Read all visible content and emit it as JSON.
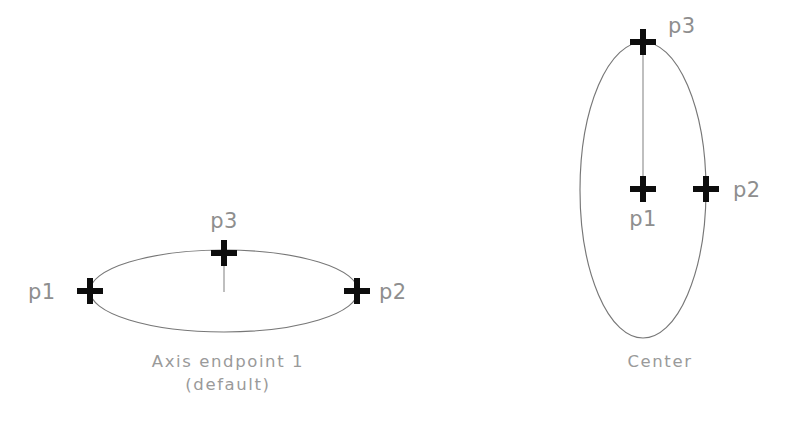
{
  "figure": {
    "background_color": "#ffffff",
    "outline_color": "#777777",
    "marker_color": "#0d0d0d",
    "label_color": "#8e8e8e",
    "caption_color": "#9a9a9a"
  },
  "diagrams": [
    {
      "id": "axis-endpoint",
      "caption_line1": "Axis endpoint 1",
      "caption_line2": "(default)",
      "orientation": "horizontal",
      "ellipse": {
        "cx": 224,
        "cy": 291,
        "rx": 134,
        "ry": 41
      },
      "points": [
        {
          "name": "p1",
          "label": "p1",
          "x": 90,
          "y": 291,
          "label_x": 28,
          "label_y": 299,
          "anchor": "start"
        },
        {
          "name": "p2",
          "label": "p2",
          "x": 357,
          "y": 291,
          "label_x": 379,
          "label_y": 299,
          "anchor": "start"
        },
        {
          "name": "p3",
          "label": "p3",
          "x": 224,
          "y": 253,
          "label_x": 224,
          "label_y": 228,
          "anchor": "middle"
        }
      ],
      "connector": {
        "x1": 224,
        "y1": 258,
        "x2": 224,
        "y2": 292
      }
    },
    {
      "id": "center",
      "caption_line1": "Center",
      "caption_line2": "",
      "orientation": "vertical",
      "ellipse": {
        "cx": 643,
        "cy": 190,
        "rx": 63,
        "ry": 148
      },
      "points": [
        {
          "name": "p1",
          "label": "p1",
          "x": 643,
          "y": 189,
          "label_x": 643,
          "label_y": 226,
          "anchor": "middle"
        },
        {
          "name": "p2",
          "label": "p2",
          "x": 706,
          "y": 189,
          "label_x": 733,
          "label_y": 197,
          "anchor": "start"
        },
        {
          "name": "p3",
          "label": "p3",
          "x": 643,
          "y": 42,
          "label_x": 668,
          "label_y": 33,
          "anchor": "start"
        }
      ],
      "connector": {
        "x1": 643,
        "y1": 47,
        "x2": 643,
        "y2": 185
      }
    }
  ],
  "marker": {
    "arm_length": 13,
    "thickness": 6
  }
}
